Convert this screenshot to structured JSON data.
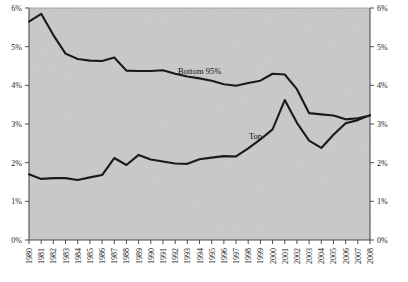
{
  "chart_data": {
    "type": "line",
    "title": "",
    "subtitle": "",
    "xlabel": "",
    "ylabel": "",
    "xlim": [
      1980,
      2008
    ],
    "ylim": [
      0,
      6
    ],
    "grid": false,
    "legend_position": "inline-annotation",
    "y_axis_left": {
      "ticks": [
        0,
        1,
        2,
        3,
        4,
        5,
        6
      ],
      "tick_labels": [
        "0%",
        "1%",
        "2%",
        "3%",
        "4%",
        "5%",
        "6%"
      ]
    },
    "y_axis_right": {
      "ticks": [
        0,
        1,
        2,
        3,
        4,
        5,
        6
      ],
      "tick_labels": [
        "0%",
        "1%",
        "2%",
        "3%",
        "4%",
        "5%",
        "6%"
      ]
    },
    "x": [
      1980,
      1981,
      1982,
      1983,
      1984,
      1985,
      1986,
      1987,
      1988,
      1989,
      1990,
      1991,
      1992,
      1993,
      1994,
      1995,
      1996,
      1997,
      1998,
      1999,
      2000,
      2001,
      2002,
      2003,
      2004,
      2005,
      2006,
      2007,
      2008
    ],
    "categories": [
      "1980",
      "1981",
      "1982",
      "1983",
      "1984",
      "1985",
      "1986",
      "1987",
      "1988",
      "1989",
      "1990",
      "1991",
      "1992",
      "1993",
      "1994",
      "1995",
      "1996",
      "1997",
      "1998",
      "1999",
      "2000",
      "2001",
      "2002",
      "2003",
      "2004",
      "2005",
      "2006",
      "2007",
      "2008"
    ],
    "series": [
      {
        "name": "Bottom 95%",
        "label": "Bottom 95%",
        "color": "#1a1a1a",
        "values": [
          5.65,
          5.85,
          5.3,
          4.82,
          4.68,
          4.64,
          4.63,
          4.72,
          4.38,
          4.37,
          4.37,
          4.39,
          4.3,
          4.23,
          4.18,
          4.12,
          4.03,
          3.99,
          4.06,
          4.12,
          4.3,
          4.28,
          3.9,
          3.28,
          3.25,
          3.22,
          3.12,
          3.15,
          3.22
        ]
      },
      {
        "name": "Top",
        "label": "Top",
        "color": "#1a1a1a",
        "values": [
          1.7,
          1.58,
          1.6,
          1.6,
          1.55,
          1.62,
          1.68,
          2.12,
          1.94,
          2.2,
          2.08,
          2.03,
          1.98,
          1.97,
          2.09,
          2.13,
          2.17,
          2.16,
          2.37,
          2.6,
          2.86,
          3.62,
          3.03,
          2.57,
          2.38,
          2.72,
          3.02,
          3.1,
          3.23
        ]
      }
    ],
    "annotations": [
      {
        "text": "Bottom 95%",
        "series": "Bottom 95%",
        "x_pos": 178,
        "y_pos": 74
      },
      {
        "text": "Top",
        "series": "Top",
        "x_pos": 249,
        "y_pos": 139
      }
    ]
  },
  "figure": {
    "background_color": "#ffffff",
    "plot_background_color": "#c9c9c9",
    "axis_color": "#4d4d4d",
    "line_color": "#1a1a1a"
  }
}
